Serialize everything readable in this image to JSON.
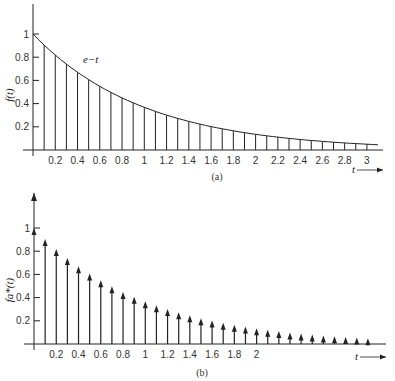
{
  "chart_data": [
    {
      "id": "a",
      "type": "bar",
      "caption": "(a)",
      "ylabel": "f(t)",
      "xlabel": "t",
      "curve_label": "e−t",
      "curve": "exp(-t)",
      "xlim": [
        0,
        3.1
      ],
      "ylim": [
        0,
        1.1
      ],
      "yticks": [
        0.2,
        0.4,
        0.6,
        0.8,
        1
      ],
      "xticks": [
        0.2,
        0.4,
        0.6,
        0.8,
        1,
        1.2,
        1.4,
        1.6,
        1.8,
        2,
        2.2,
        2.4,
        2.6,
        2.8,
        3
      ],
      "x": [
        0.1,
        0.2,
        0.3,
        0.4,
        0.5,
        0.6,
        0.7,
        0.8,
        0.9,
        1.0,
        1.1,
        1.2,
        1.3,
        1.4,
        1.5,
        1.6,
        1.7,
        1.8,
        1.9,
        2.0,
        2.1,
        2.2,
        2.3,
        2.4,
        2.5,
        2.6,
        2.7,
        2.8,
        2.9,
        3.0
      ],
      "values": [
        0.905,
        0.819,
        0.741,
        0.67,
        0.607,
        0.549,
        0.497,
        0.449,
        0.407,
        0.368,
        0.333,
        0.301,
        0.273,
        0.247,
        0.223,
        0.202,
        0.183,
        0.165,
        0.15,
        0.135,
        0.122,
        0.111,
        0.1,
        0.091,
        0.082,
        0.074,
        0.067,
        0.061,
        0.055,
        0.05
      ]
    },
    {
      "id": "b",
      "type": "bar",
      "caption": "(b)",
      "ylabel": "fa*(t)",
      "xlabel": "t",
      "style": "impulse-arrows",
      "xlim": [
        0,
        3.1
      ],
      "ylim": [
        0,
        1.1
      ],
      "yticks": [
        0.2,
        0.4,
        0.6,
        0.8,
        1
      ],
      "xticks": [
        0.2,
        0.4,
        0.6,
        0.8,
        1,
        1.2,
        1.4,
        1.6,
        1.8,
        2
      ],
      "x": [
        0,
        0.1,
        0.2,
        0.3,
        0.4,
        0.5,
        0.6,
        0.7,
        0.8,
        0.9,
        1.0,
        1.1,
        1.2,
        1.3,
        1.4,
        1.5,
        1.6,
        1.7,
        1.8,
        1.9,
        2.0,
        2.1,
        2.2,
        2.3,
        2.4,
        2.5,
        2.6,
        2.7,
        2.8,
        2.9,
        3.0
      ],
      "values": [
        1.0,
        0.905,
        0.819,
        0.741,
        0.67,
        0.607,
        0.549,
        0.497,
        0.449,
        0.407,
        0.368,
        0.333,
        0.301,
        0.273,
        0.247,
        0.223,
        0.202,
        0.183,
        0.165,
        0.15,
        0.135,
        0.122,
        0.111,
        0.1,
        0.091,
        0.082,
        0.074,
        0.067,
        0.061,
        0.055,
        0.05
      ]
    }
  ]
}
